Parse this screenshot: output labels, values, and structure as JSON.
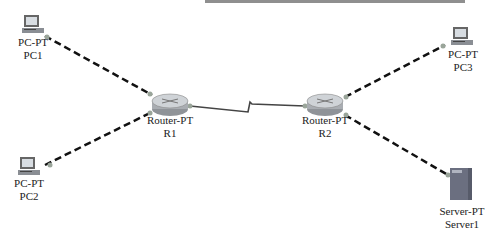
{
  "diagram": {
    "title": "",
    "colors": {
      "link_dashed": "#111111",
      "link_serial": "#444444",
      "port_dot": "#9aa59a",
      "router_body": "#b8bcc0",
      "pc_screen": "#8a8e94",
      "server_body": "#6b6f80",
      "label_text": "#222222"
    },
    "nodes": [
      {
        "id": "PC1",
        "type": "PC-PT",
        "name": "PC1",
        "icon": "pc-icon",
        "x": 25,
        "y": 18
      },
      {
        "id": "PC2",
        "type": "PC-PT",
        "name": "PC2",
        "icon": "pc-icon",
        "x": 18,
        "y": 160
      },
      {
        "id": "R1",
        "type": "Router-PT",
        "name": "R1",
        "icon": "router-icon",
        "x": 160,
        "y": 95
      },
      {
        "id": "R2",
        "type": "Router-PT",
        "name": "R2",
        "icon": "router-icon",
        "x": 325,
        "y": 95
      },
      {
        "id": "PC3",
        "type": "PC-PT",
        "name": "PC3",
        "icon": "pc-icon",
        "x": 460,
        "y": 30
      },
      {
        "id": "Server1",
        "type": "Server-PT",
        "name": "Server1",
        "icon": "server-icon",
        "x": 455,
        "y": 170
      }
    ],
    "links": [
      {
        "from": "PC1",
        "to": "R1",
        "style": "dashed",
        "kind": "copper-cross-over"
      },
      {
        "from": "PC2",
        "to": "R1",
        "style": "dashed",
        "kind": "copper-cross-over"
      },
      {
        "from": "R1",
        "to": "R2",
        "style": "serial",
        "kind": "serial-dce"
      },
      {
        "from": "R2",
        "to": "PC3",
        "style": "dashed",
        "kind": "copper-cross-over"
      },
      {
        "from": "R2",
        "to": "Server1",
        "style": "dashed",
        "kind": "copper-cross-over"
      }
    ],
    "labels": {
      "pc1": {
        "type": "PC-PT",
        "name": "PC1"
      },
      "pc2": {
        "type": "PC-PT",
        "name": "PC2"
      },
      "r1": {
        "type": "Router-PT",
        "name": "R1"
      },
      "r2": {
        "type": "Router-PT",
        "name": "R2"
      },
      "pc3": {
        "type": "PC-PT",
        "name": "PC3"
      },
      "server1": {
        "type": "Server-PT",
        "name": "Server1"
      }
    }
  }
}
